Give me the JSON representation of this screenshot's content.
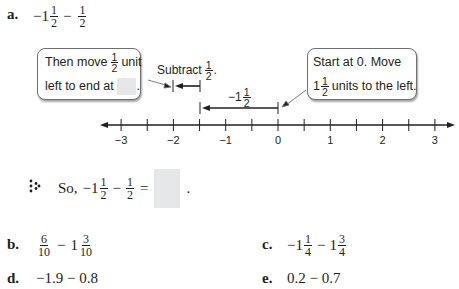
{
  "problem_a": {
    "label": "a.",
    "expr": {
      "lead": "−1",
      "frac1": {
        "num": "1",
        "den": "2"
      },
      "op": "−",
      "frac2": {
        "num": "1",
        "den": "2"
      }
    },
    "callout_left": {
      "line1_pre": "Then move",
      "line1_frac": {
        "num": "1",
        "den": "2"
      },
      "line1_post": "unit",
      "line2_pre": "left to end at",
      "line2_post": "."
    },
    "subtract_label": {
      "text": "Subtract",
      "frac": {
        "num": "1",
        "den": "2"
      },
      "post": "."
    },
    "long_arrow_label": {
      "lead": "−1",
      "frac": {
        "num": "1",
        "den": "2"
      }
    },
    "callout_right": {
      "line1": "Start at 0. Move",
      "line2_lead": "1",
      "line2_frac": {
        "num": "1",
        "den": "2"
      },
      "line2_post": "units to the left."
    },
    "number_line": {
      "min": -3,
      "max": 3,
      "tick_step": 0.5,
      "labels": [
        "−3",
        "−2",
        "−1",
        "0",
        "1",
        "2",
        "3"
      ]
    },
    "conclusion": {
      "prefix": "So,",
      "lead": "−1",
      "frac1": {
        "num": "1",
        "den": "2"
      },
      "op": "−",
      "frac2": {
        "num": "1",
        "den": "2"
      },
      "eq": "=",
      "post": "."
    }
  },
  "problem_b": {
    "label": "b.",
    "frac1": {
      "num": "6",
      "den": "10"
    },
    "op": "−",
    "lead2": "1",
    "frac2": {
      "num": "3",
      "den": "10"
    }
  },
  "problem_c": {
    "label": "c.",
    "lead1": "−1",
    "frac1": {
      "num": "1",
      "den": "4"
    },
    "op": "−",
    "lead2": "1",
    "frac2": {
      "num": "3",
      "den": "4"
    }
  },
  "problem_d": {
    "label": "d.",
    "expr": "−1.9 − 0.8"
  },
  "problem_e": {
    "label": "e.",
    "expr": "0.2 − 0.7"
  },
  "colors": {
    "answer_box": "#e6e7e8",
    "ink": "#231f20",
    "callout_border": "#6d6e71"
  }
}
